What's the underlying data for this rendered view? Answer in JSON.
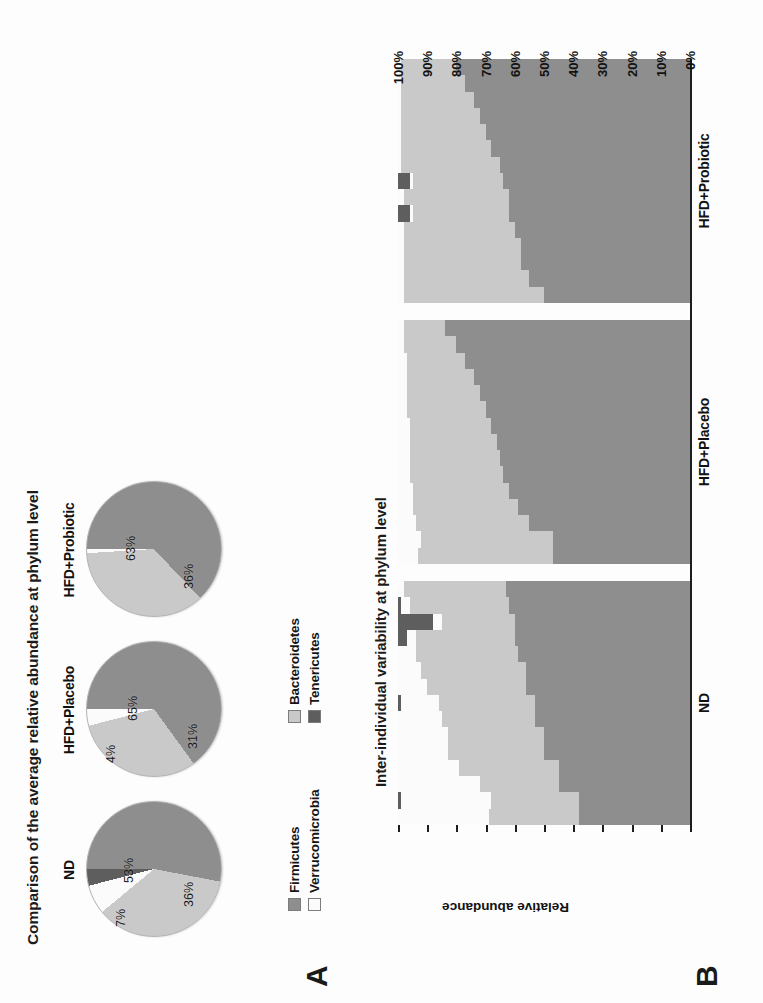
{
  "figure": {
    "panel_a_letter": "A",
    "panel_b_letter": "B"
  },
  "panelA": {
    "title": "Comparison of the average relative abundance at phylum level",
    "groups": [
      {
        "name": "ND",
        "labels": [
          {
            "text": "53%",
            "left": 62,
            "top": 40
          },
          {
            "text": "36%",
            "left": 38,
            "top": 100
          },
          {
            "text": "7%",
            "left": 18,
            "top": 32
          }
        ]
      },
      {
        "name": "HFD+Placebo",
        "labels": [
          {
            "text": "65%",
            "left": 64,
            "top": 44
          },
          {
            "text": "31%",
            "left": 36,
            "top": 104
          },
          {
            "text": "4%",
            "left": 22,
            "top": 22
          }
        ]
      },
      {
        "name": "HFD+Probiotic",
        "labels": [
          {
            "text": "63%",
            "left": 64,
            "top": 42
          },
          {
            "text": "36%",
            "left": 36,
            "top": 100
          }
        ]
      }
    ],
    "legend": [
      {
        "label": "Firmicutes",
        "color": "#8e8e8e"
      },
      {
        "label": "Verrucomicrobia",
        "color": "#fbfbfb"
      },
      {
        "label": "Bacteroidetes",
        "color": "#c9c9c9"
      },
      {
        "label": "Tenericutes",
        "color": "#5e5e5e"
      }
    ]
  },
  "panelB": {
    "title": "Inter-individual variability at phylum level",
    "ylabel": "Relative abundance",
    "yticks": [
      "100%",
      "90%",
      "80%",
      "70%",
      "60%",
      "50%",
      "40%",
      "30%",
      "20%",
      "10%",
      "0%"
    ],
    "groups": [
      "ND",
      "HFD+Placebo",
      "HFD+Probiotic"
    ]
  },
  "chart_data": [
    {
      "type": "pie",
      "title": "ND",
      "labels": [
        "Firmicutes",
        "Bacteroidetes",
        "Verrucomicrobia",
        "Tenericutes"
      ],
      "values": [
        53,
        36,
        7,
        4
      ],
      "data_labels": [
        "53%",
        "36%",
        "7%",
        ""
      ],
      "colors": [
        "#8e8e8e",
        "#c9c9c9",
        "#fbfbfb",
        "#5e5e5e"
      ]
    },
    {
      "type": "pie",
      "title": "HFD+Placebo",
      "labels": [
        "Firmicutes",
        "Bacteroidetes",
        "Verrucomicrobia",
        "Tenericutes"
      ],
      "values": [
        65,
        31,
        4,
        0
      ],
      "data_labels": [
        "65%",
        "31%",
        "4%",
        ""
      ],
      "colors": [
        "#8e8e8e",
        "#c9c9c9",
        "#fbfbfb",
        "#5e5e5e"
      ]
    },
    {
      "type": "pie",
      "title": "HFD+Probiotic",
      "labels": [
        "Firmicutes",
        "Bacteroidetes",
        "Verrucomicrobia",
        "Tenericutes"
      ],
      "values": [
        63,
        36,
        1,
        0
      ],
      "data_labels": [
        "63%",
        "36%",
        "",
        ""
      ],
      "colors": [
        "#8e8e8e",
        "#c9c9c9",
        "#fbfbfb",
        "#5e5e5e"
      ]
    },
    {
      "type": "bar",
      "stacked": true,
      "title": "Inter-individual variability at phylum level",
      "xlabel": "",
      "ylabel": "Relative abundance",
      "ylim": [
        0,
        100
      ],
      "yticks": [
        0,
        10,
        20,
        30,
        40,
        50,
        60,
        70,
        80,
        90,
        100
      ],
      "grid": false,
      "legend_position": "none",
      "series": [
        {
          "name": "Firmicutes",
          "color": "#8e8e8e"
        },
        {
          "name": "Bacteroidetes",
          "color": "#c9c9c9"
        },
        {
          "name": "Verrucomicrobia",
          "color": "#fbfbfb"
        },
        {
          "name": "Tenericutes",
          "color": "#5e5e5e"
        }
      ],
      "groups": [
        {
          "name": "ND",
          "bars": [
            {
              "Firmicutes": 38,
              "Bacteroidetes": 31,
              "Verrucomicrobia": 31,
              "Tenericutes": 0
            },
            {
              "Firmicutes": 38,
              "Bacteroidetes": 30,
              "Verrucomicrobia": 31,
              "Tenericutes": 1
            },
            {
              "Firmicutes": 45,
              "Bacteroidetes": 27,
              "Verrucomicrobia": 28,
              "Tenericutes": 0
            },
            {
              "Firmicutes": 45,
              "Bacteroidetes": 34,
              "Verrucomicrobia": 21,
              "Tenericutes": 0
            },
            {
              "Firmicutes": 50,
              "Bacteroidetes": 33,
              "Verrucomicrobia": 17,
              "Tenericutes": 0
            },
            {
              "Firmicutes": 50,
              "Bacteroidetes": 33,
              "Verrucomicrobia": 17,
              "Tenericutes": 0
            },
            {
              "Firmicutes": 53,
              "Bacteroidetes": 32,
              "Verrucomicrobia": 15,
              "Tenericutes": 0
            },
            {
              "Firmicutes": 53,
              "Bacteroidetes": 33,
              "Verrucomicrobia": 13,
              "Tenericutes": 1
            },
            {
              "Firmicutes": 56,
              "Bacteroidetes": 34,
              "Verrucomicrobia": 10,
              "Tenericutes": 0
            },
            {
              "Firmicutes": 56,
              "Bacteroidetes": 36,
              "Verrucomicrobia": 8,
              "Tenericutes": 0
            },
            {
              "Firmicutes": 59,
              "Bacteroidetes": 35,
              "Verrucomicrobia": 6,
              "Tenericutes": 0
            },
            {
              "Firmicutes": 60,
              "Bacteroidetes": 34,
              "Verrucomicrobia": 3,
              "Tenericutes": 3
            },
            {
              "Firmicutes": 60,
              "Bacteroidetes": 25,
              "Verrucomicrobia": 3,
              "Tenericutes": 12
            },
            {
              "Firmicutes": 62,
              "Bacteroidetes": 34,
              "Verrucomicrobia": 3,
              "Tenericutes": 1
            },
            {
              "Firmicutes": 63,
              "Bacteroidetes": 35,
              "Verrucomicrobia": 2,
              "Tenericutes": 0
            }
          ]
        },
        {
          "name": "HFD+Placebo",
          "bars": [
            {
              "Firmicutes": 47,
              "Bacteroidetes": 46,
              "Verrucomicrobia": 7,
              "Tenericutes": 0
            },
            {
              "Firmicutes": 47,
              "Bacteroidetes": 45,
              "Verrucomicrobia": 8,
              "Tenericutes": 0
            },
            {
              "Firmicutes": 55,
              "Bacteroidetes": 39,
              "Verrucomicrobia": 6,
              "Tenericutes": 0
            },
            {
              "Firmicutes": 59,
              "Bacteroidetes": 36,
              "Verrucomicrobia": 5,
              "Tenericutes": 0
            },
            {
              "Firmicutes": 62,
              "Bacteroidetes": 33,
              "Verrucomicrobia": 5,
              "Tenericutes": 0
            },
            {
              "Firmicutes": 64,
              "Bacteroidetes": 32,
              "Verrucomicrobia": 4,
              "Tenericutes": 0
            },
            {
              "Firmicutes": 65,
              "Bacteroidetes": 31,
              "Verrucomicrobia": 4,
              "Tenericutes": 0
            },
            {
              "Firmicutes": 66,
              "Bacteroidetes": 30,
              "Verrucomicrobia": 4,
              "Tenericutes": 0
            },
            {
              "Firmicutes": 68,
              "Bacteroidetes": 28,
              "Verrucomicrobia": 4,
              "Tenericutes": 0
            },
            {
              "Firmicutes": 70,
              "Bacteroidetes": 27,
              "Verrucomicrobia": 3,
              "Tenericutes": 0
            },
            {
              "Firmicutes": 72,
              "Bacteroidetes": 25,
              "Verrucomicrobia": 3,
              "Tenericutes": 0
            },
            {
              "Firmicutes": 74,
              "Bacteroidetes": 23,
              "Verrucomicrobia": 3,
              "Tenericutes": 0
            },
            {
              "Firmicutes": 77,
              "Bacteroidetes": 20,
              "Verrucomicrobia": 3,
              "Tenericutes": 0
            },
            {
              "Firmicutes": 80,
              "Bacteroidetes": 18,
              "Verrucomicrobia": 2,
              "Tenericutes": 0
            },
            {
              "Firmicutes": 84,
              "Bacteroidetes": 14,
              "Verrucomicrobia": 2,
              "Tenericutes": 0
            }
          ]
        },
        {
          "name": "HFD+Probiotic",
          "bars": [
            {
              "Firmicutes": 50,
              "Bacteroidetes": 48,
              "Verrucomicrobia": 2,
              "Tenericutes": 0
            },
            {
              "Firmicutes": 55,
              "Bacteroidetes": 43,
              "Verrucomicrobia": 2,
              "Tenericutes": 0
            },
            {
              "Firmicutes": 58,
              "Bacteroidetes": 40,
              "Verrucomicrobia": 2,
              "Tenericutes": 0
            },
            {
              "Firmicutes": 58,
              "Bacteroidetes": 40,
              "Verrucomicrobia": 2,
              "Tenericutes": 0
            },
            {
              "Firmicutes": 60,
              "Bacteroidetes": 38,
              "Verrucomicrobia": 2,
              "Tenericutes": 0
            },
            {
              "Firmicutes": 62,
              "Bacteroidetes": 33,
              "Verrucomicrobia": 1,
              "Tenericutes": 4
            },
            {
              "Firmicutes": 62,
              "Bacteroidetes": 36,
              "Verrucomicrobia": 2,
              "Tenericutes": 0
            },
            {
              "Firmicutes": 64,
              "Bacteroidetes": 31,
              "Verrucomicrobia": 1,
              "Tenericutes": 4
            },
            {
              "Firmicutes": 65,
              "Bacteroidetes": 34,
              "Verrucomicrobia": 1,
              "Tenericutes": 0
            },
            {
              "Firmicutes": 68,
              "Bacteroidetes": 31,
              "Verrucomicrobia": 1,
              "Tenericutes": 0
            },
            {
              "Firmicutes": 70,
              "Bacteroidetes": 29,
              "Verrucomicrobia": 1,
              "Tenericutes": 0
            },
            {
              "Firmicutes": 72,
              "Bacteroidetes": 27,
              "Verrucomicrobia": 1,
              "Tenericutes": 0
            },
            {
              "Firmicutes": 74,
              "Bacteroidetes": 25,
              "Verrucomicrobia": 1,
              "Tenericutes": 0
            },
            {
              "Firmicutes": 77,
              "Bacteroidetes": 22,
              "Verrucomicrobia": 1,
              "Tenericutes": 0
            },
            {
              "Firmicutes": 80,
              "Bacteroidetes": 19,
              "Verrucomicrobia": 1,
              "Tenericutes": 0
            }
          ]
        }
      ]
    }
  ]
}
